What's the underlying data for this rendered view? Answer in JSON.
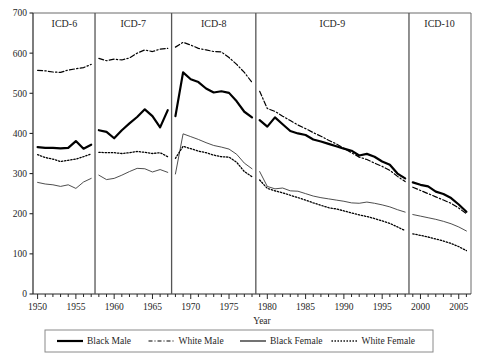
{
  "chart_data": {
    "type": "line",
    "title": "",
    "xlabel": "Year",
    "ylabel": "",
    "xlim": [
      1949.4,
      2006.6
    ],
    "ylim": [
      0,
      700
    ],
    "grid": false,
    "legend_position": "bottom",
    "y_ticks": [
      0,
      100,
      200,
      300,
      400,
      500,
      600,
      700
    ],
    "x_ticks": [
      1950,
      1955,
      1960,
      1965,
      1970,
      1975,
      1980,
      1985,
      1990,
      1995,
      2000,
      2005
    ],
    "x_tick_labels": [
      "1950",
      "1955",
      "1960",
      "1965",
      "1970",
      "1975",
      "1980",
      "1985",
      "1990",
      "1995",
      "2000",
      "2005"
    ],
    "x_minor_tick_step": 1,
    "panels": [
      {
        "label": "ICD-6",
        "start": 1950,
        "end": 1957
      },
      {
        "label": "ICD-7",
        "start": 1958,
        "end": 1967
      },
      {
        "label": "ICD-8",
        "start": 1968,
        "end": 1978
      },
      {
        "label": "ICD-9",
        "start": 1979,
        "end": 1998
      },
      {
        "label": "ICD-10",
        "start": 1999,
        "end": 2006
      }
    ],
    "panel_boundaries": [
      1957.5,
      1967.5,
      1978.5,
      1998.5
    ],
    "series": [
      {
        "name": "Black Male",
        "style": "solid",
        "width": 2.2,
        "color": "#000000",
        "x": [
          1950,
          1951,
          1952,
          1953,
          1954,
          1955,
          1956,
          1957,
          1958,
          1959,
          1960,
          1961,
          1962,
          1963,
          1964,
          1965,
          1966,
          1967,
          1968,
          1969,
          1970,
          1971,
          1972,
          1973,
          1974,
          1975,
          1976,
          1977,
          1978,
          1979,
          1980,
          1981,
          1982,
          1983,
          1984,
          1985,
          1986,
          1987,
          1988,
          1989,
          1990,
          1991,
          1992,
          1993,
          1994,
          1995,
          1996,
          1997,
          1998,
          1999,
          2000,
          2001,
          2002,
          2003,
          2004,
          2005,
          2006
        ],
        "values": [
          366,
          364,
          364,
          363,
          364,
          381,
          362,
          372,
          408,
          404,
          388,
          408,
          425,
          441,
          460,
          443,
          415,
          458,
          443,
          552,
          535,
          528,
          512,
          502,
          505,
          501,
          480,
          454,
          440,
          433,
          417,
          440,
          423,
          406,
          400,
          396,
          385,
          380,
          374,
          368,
          362,
          357,
          345,
          349,
          342,
          330,
          322,
          300,
          288,
          278,
          272,
          268,
          255,
          249,
          239,
          223,
          205
        ]
      },
      {
        "name": "White Male",
        "style": "dashdot",
        "width": 1.2,
        "color": "#000000",
        "x": [
          1950,
          1951,
          1952,
          1953,
          1954,
          1955,
          1956,
          1957,
          1958,
          1959,
          1960,
          1961,
          1962,
          1963,
          1964,
          1965,
          1966,
          1967,
          1968,
          1969,
          1970,
          1971,
          1972,
          1973,
          1974,
          1975,
          1976,
          1977,
          1978,
          1979,
          1980,
          1981,
          1982,
          1983,
          1984,
          1985,
          1986,
          1987,
          1988,
          1989,
          1990,
          1991,
          1992,
          1993,
          1994,
          1995,
          1996,
          1997,
          1998,
          1999,
          2000,
          2001,
          2002,
          2003,
          2004,
          2005,
          2006
        ],
        "values": [
          557,
          556,
          553,
          552,
          558,
          561,
          564,
          572,
          587,
          581,
          585,
          583,
          588,
          600,
          608,
          604,
          610,
          612,
          615,
          627,
          620,
          612,
          608,
          604,
          603,
          589,
          572,
          552,
          527,
          505,
          462,
          455,
          443,
          432,
          421,
          412,
          402,
          393,
          383,
          374,
          363,
          352,
          341,
          335,
          326,
          318,
          308,
          293,
          280,
          266,
          258,
          250,
          242,
          234,
          226,
          214,
          200
        ]
      },
      {
        "name": "Black Female",
        "style": "solid",
        "width": 0.9,
        "color": "#3a3a3a",
        "x": [
          1950,
          1951,
          1952,
          1953,
          1954,
          1955,
          1956,
          1957,
          1958,
          1959,
          1960,
          1961,
          1962,
          1963,
          1964,
          1965,
          1966,
          1967,
          1968,
          1969,
          1970,
          1971,
          1972,
          1973,
          1974,
          1975,
          1976,
          1977,
          1978,
          1979,
          1980,
          1981,
          1982,
          1983,
          1984,
          1985,
          1986,
          1987,
          1988,
          1989,
          1990,
          1991,
          1992,
          1993,
          1994,
          1995,
          1996,
          1997,
          1998,
          1999,
          2000,
          2001,
          2002,
          2003,
          2004,
          2005,
          2006
        ],
        "values": [
          278,
          274,
          272,
          268,
          272,
          263,
          279,
          288,
          296,
          285,
          288,
          296,
          305,
          313,
          312,
          304,
          310,
          303,
          299,
          399,
          392,
          385,
          377,
          370,
          366,
          361,
          348,
          326,
          312,
          305,
          268,
          262,
          264,
          257,
          256,
          250,
          244,
          240,
          237,
          234,
          231,
          227,
          226,
          229,
          226,
          222,
          217,
          210,
          204,
          198,
          194,
          190,
          186,
          181,
          175,
          167,
          157
        ]
      },
      {
        "name": "White Female",
        "style": "dotted",
        "width": 1.3,
        "color": "#000000",
        "x": [
          1950,
          1951,
          1952,
          1953,
          1954,
          1955,
          1956,
          1957,
          1958,
          1959,
          1960,
          1961,
          1962,
          1963,
          1964,
          1965,
          1966,
          1967,
          1968,
          1969,
          1970,
          1971,
          1972,
          1973,
          1974,
          1975,
          1976,
          1977,
          1978,
          1979,
          1980,
          1981,
          1982,
          1983,
          1984,
          1985,
          1986,
          1987,
          1988,
          1989,
          1990,
          1991,
          1992,
          1993,
          1994,
          1995,
          1996,
          1997,
          1998,
          1999,
          2000,
          2001,
          2002,
          2003,
          2004,
          2005,
          2006
        ],
        "values": [
          347,
          340,
          336,
          330,
          333,
          336,
          342,
          349,
          353,
          352,
          352,
          350,
          352,
          355,
          353,
          350,
          352,
          342,
          338,
          368,
          362,
          356,
          352,
          346,
          342,
          341,
          328,
          305,
          292,
          284,
          263,
          257,
          252,
          246,
          240,
          234,
          227,
          221,
          215,
          212,
          207,
          202,
          197,
          193,
          188,
          182,
          176,
          167,
          158,
          150,
          146,
          142,
          137,
          132,
          126,
          118,
          108
        ]
      }
    ]
  },
  "legend": {
    "items": [
      {
        "label": "Black Male",
        "style": "solid-thick"
      },
      {
        "label": "White Male",
        "style": "dashdot"
      },
      {
        "label": "Black Female",
        "style": "solid-thin"
      },
      {
        "label": "White Female",
        "style": "dotted"
      }
    ]
  },
  "colors": {
    "axis": "#262626",
    "panel_divider": "#555555",
    "frame": "#6a6a6a",
    "series_black": "#000000",
    "series_gray": "#3a3a3a"
  }
}
